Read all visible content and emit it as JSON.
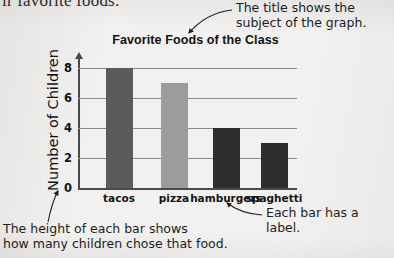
{
  "page": {
    "background_color": "#f2f1ef",
    "cutoff_running_text": "ir favorite foods."
  },
  "annotations": {
    "title_note": "The title shows the\nsubject of the graph.",
    "label_note": "Each bar has a label.",
    "height_note": "The height of each bar shows\nhow many children chose that food."
  },
  "chart_data": {
    "type": "bar",
    "title": "Favorite Foods of the Class",
    "xlabel": "",
    "ylabel": "Number of Children",
    "categories": [
      "tacos",
      "pizza",
      "hamburgers",
      "spaghetti"
    ],
    "values": [
      8,
      7,
      4,
      3
    ],
    "bar_colors": [
      "#5b5b5b",
      "#9c9c9c",
      "#2d2d2d",
      "#2d2d2d"
    ],
    "ylim": [
      0,
      8
    ],
    "yticks": [
      0,
      2,
      4,
      6,
      8
    ],
    "ytick_labels": [
      "0",
      "2",
      "4",
      "6",
      "8"
    ],
    "grid": true,
    "legend": "none",
    "axis_color": "#4a4a4a",
    "grid_color": "#8d8d8d"
  }
}
